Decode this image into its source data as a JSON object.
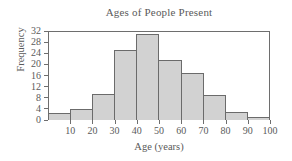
{
  "chart_data": {
    "type": "bar",
    "title": "Ages of People Present",
    "xlabel": "Age (years)",
    "ylabel": "Frequency",
    "grid": false,
    "legend": null,
    "bin_width": 10,
    "bin_edges": [
      0,
      10,
      20,
      30,
      40,
      50,
      60,
      70,
      80,
      90,
      100
    ],
    "categories": [
      "0-10",
      "10-20",
      "20-30",
      "30-40",
      "40-50",
      "50-60",
      "60-70",
      "70-80",
      "80-90",
      "90-100"
    ],
    "values": [
      2.5,
      4,
      9.5,
      25,
      31,
      21.5,
      17,
      9,
      3,
      1
    ],
    "xlim": [
      0,
      100
    ],
    "ylim": [
      0,
      32
    ],
    "xticks": [
      10,
      20,
      30,
      40,
      50,
      60,
      70,
      80,
      90,
      100
    ],
    "xtick_labels": [
      "10",
      "20",
      "30",
      "40",
      "50",
      "60",
      "70",
      "80",
      "90",
      "100"
    ],
    "yticks": [
      0,
      4,
      8,
      12,
      16,
      20,
      24,
      28,
      32
    ],
    "ytick_labels": [
      "0",
      "4",
      "8",
      "12",
      "16",
      "20",
      "24",
      "28",
      "32"
    ],
    "bar_fill_color": "#d2d2d2",
    "bar_edge_color": "#6b6b6b",
    "axis_color": "#6e6e6e",
    "text_color": "#5a5a5a",
    "background_color": "#ffffff"
  }
}
